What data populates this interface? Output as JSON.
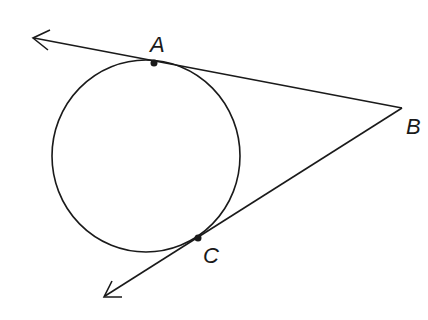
{
  "diagram": {
    "stroke_color": "#1a1a1a",
    "circle": {
      "cx": 146,
      "cy": 156,
      "rx": 94,
      "ry": 96
    },
    "points": {
      "A": {
        "label": "A",
        "x": 154,
        "y": 63,
        "label_x": 150,
        "label_y": 52
      },
      "B": {
        "label": "B",
        "x": 402,
        "y": 108,
        "label_x": 406,
        "label_y": 134
      },
      "C": {
        "label": "C",
        "x": 198,
        "y": 238,
        "label_x": 203,
        "label_y": 263
      }
    },
    "rays": [
      {
        "name": "ray-BA",
        "from": "B",
        "toward": "A",
        "arrow_tip": [
          33,
          38
        ]
      },
      {
        "name": "ray-BC",
        "from": "B",
        "toward": "C",
        "arrow_tip": [
          104,
          297
        ]
      }
    ]
  }
}
